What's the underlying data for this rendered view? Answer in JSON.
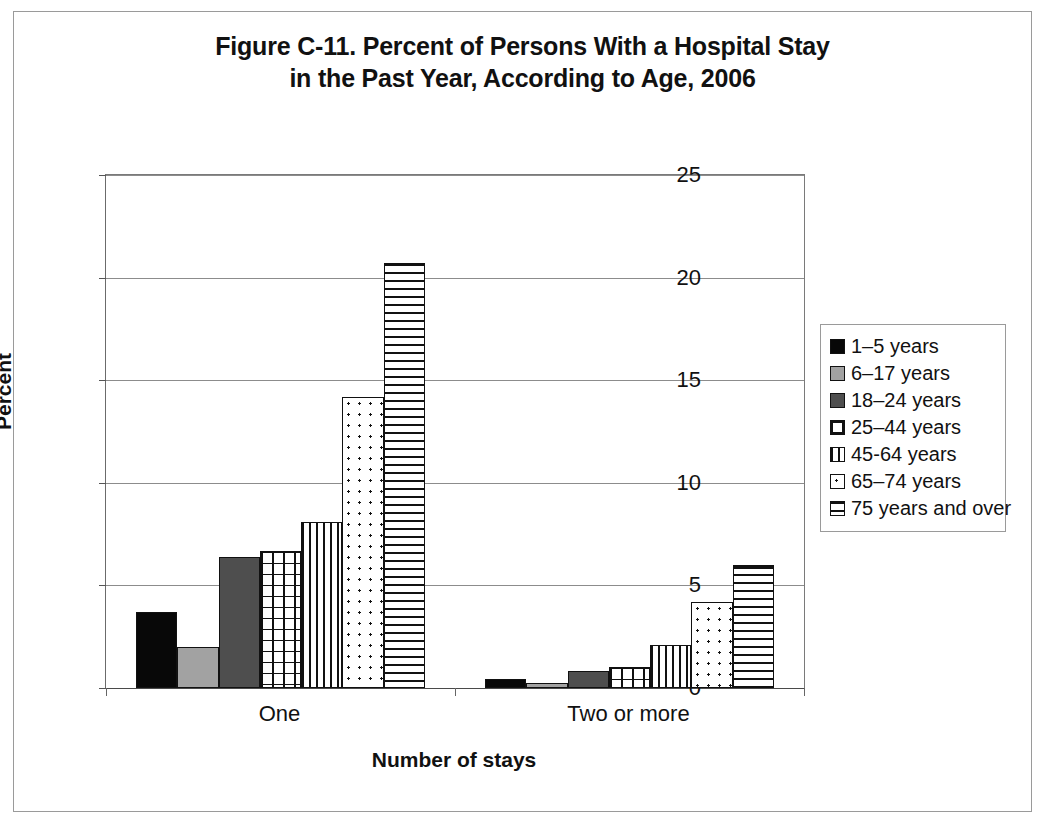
{
  "chart_data": {
    "type": "bar",
    "title": "Figure C-11. Percent of Persons With a Hospital Stay in the Past Year, According to Age, 2006",
    "title_lines": [
      "Figure C-11. Percent of Persons With a Hospital Stay",
      "in the Past Year, According to Age, 2006"
    ],
    "xlabel": "Number of stays",
    "ylabel": "Percent",
    "categories": [
      "One",
      "Two or more"
    ],
    "ylim": [
      0,
      25
    ],
    "yticks": [
      0,
      5,
      10,
      15,
      20,
      25
    ],
    "ytick_labels": [
      "0",
      "5",
      "10",
      "15",
      "20",
      "25"
    ],
    "grid": "horizontal",
    "legend_position": "right",
    "series": [
      {
        "name": "1–5 years",
        "pattern": "solid",
        "values": [
          3.7,
          0.45
        ]
      },
      {
        "name": "6–17 years",
        "pattern": "gray",
        "values": [
          2.0,
          0.25
        ]
      },
      {
        "name": "18–24 years",
        "pattern": "darkgray",
        "values": [
          6.4,
          0.85
        ]
      },
      {
        "name": "25–44 years",
        "pattern": "grid",
        "values": [
          6.7,
          1.0
        ]
      },
      {
        "name": "45-64 years",
        "pattern": "vlines",
        "values": [
          8.1,
          2.1
        ]
      },
      {
        "name": "65–74 years",
        "pattern": "dots",
        "values": [
          14.2,
          4.2
        ]
      },
      {
        "name": "75 years and over",
        "pattern": "hlines",
        "values": [
          20.7,
          6.0
        ]
      }
    ]
  }
}
